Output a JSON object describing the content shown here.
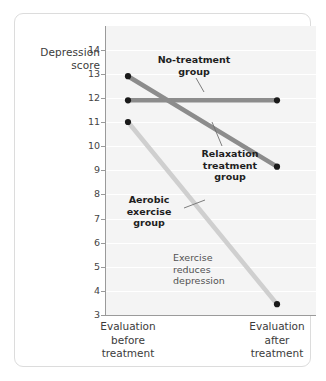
{
  "chart_data": {
    "type": "line",
    "title": "",
    "subtitle": "",
    "xlabel": "",
    "ylabel": "Depression score",
    "categories": [
      "Evaluation before treatment",
      "Evaluation after treatment"
    ],
    "x": [
      0,
      1
    ],
    "ylim": [
      3,
      14
    ],
    "yticks": [
      14,
      13,
      12,
      11,
      10,
      9,
      8,
      7,
      6,
      5,
      4,
      3
    ],
    "grid": true,
    "legend_position": "inline-annotations",
    "series": [
      {
        "name": "No-treatment group",
        "values": [
          11.9,
          11.9
        ],
        "color": "#8c8c8c",
        "markers": true
      },
      {
        "name": "Relaxation treatment group",
        "values": [
          12.9,
          9.15
        ],
        "color": "#8c8c8c",
        "markers": true
      },
      {
        "name": "Aerobic exercise group",
        "values": [
          11.0,
          3.45
        ],
        "color": "#cfcfcf",
        "markers": true
      }
    ],
    "annotations": [
      {
        "text": "No-treatment group",
        "bold": true
      },
      {
        "text": "Relaxation treatment group",
        "bold": true
      },
      {
        "text": "Aerobic exercise group",
        "bold": true
      },
      {
        "text": "Exercise reduces depression",
        "bold": false
      }
    ]
  },
  "axis": {
    "y_title_line1": "Depression",
    "y_title_line2": "score",
    "ticks": [
      "14",
      "13",
      "12",
      "11",
      "10",
      "9",
      "8",
      "7",
      "6",
      "5",
      "4",
      "3"
    ],
    "x_labels": [
      {
        "line1": "Evaluation",
        "line2": "before",
        "line3": "treatment"
      },
      {
        "line1": "Evaluation",
        "line2": "after",
        "line3": "treatment"
      }
    ]
  },
  "annotations": {
    "no_treatment": {
      "line1": "No-treatment",
      "line2": "group"
    },
    "relaxation": {
      "line1": "Relaxation",
      "line2": "treatment",
      "line3": "group"
    },
    "aerobic": {
      "line1": "Aerobic",
      "line2": "exercise",
      "line3": "group"
    },
    "exercise_note": {
      "line1": "Exercise",
      "line2": "reduces",
      "line3": "depression"
    }
  },
  "colors": {
    "plot_background": "#f4f4f4",
    "gridline": "#ffffff",
    "axis": "#9a9a9a",
    "dark_series": "#8c8c8c",
    "light_series": "#cfcfcf",
    "marker": "#1a1a1a",
    "frame_border": "#dcdcdc",
    "text": "#3b3b3b"
  }
}
